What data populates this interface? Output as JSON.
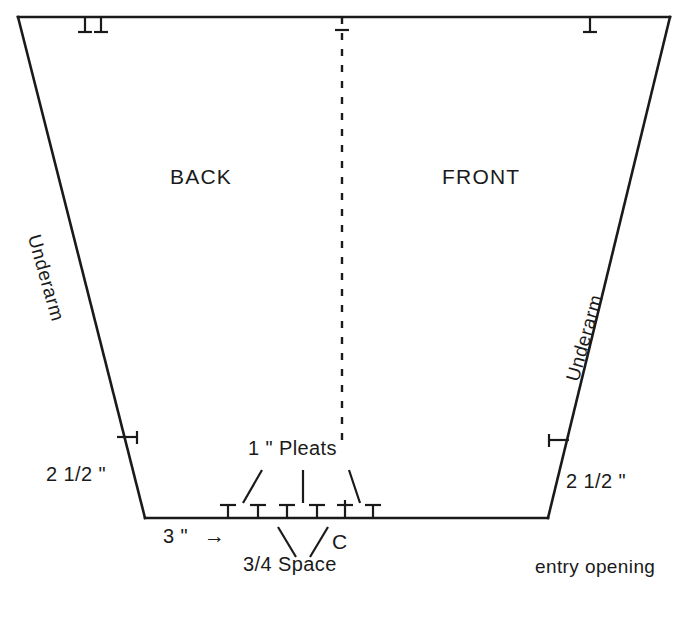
{
  "diagram": {
    "colors": {
      "line": "#1a1a1a",
      "text": "#1a1a1a",
      "background": "#ffffff"
    },
    "panels": {
      "back_label": "BACK",
      "front_label": "FRONT"
    },
    "edges": {
      "underarm_left_label": "Underarm",
      "underarm_right_label": "Underarm"
    },
    "measurements": {
      "left_hem_allowance": "2 1/2 \"",
      "right_hem_allowance": "2 1/2 \"",
      "pleat_width": "1 \" Pleats",
      "pleat_space": "3/4 Space",
      "bottom_offset": "3 \"",
      "arrow_glyph": "→",
      "center_mark": "C"
    },
    "annotations": {
      "entry_opening": "entry opening"
    },
    "geometry": {
      "top_left": [
        18,
        17
      ],
      "top_right": [
        670,
        17
      ],
      "bottom_left": [
        145,
        518
      ],
      "bottom_right": [
        548,
        518
      ],
      "center_line_x": 342,
      "center_line_top": 17,
      "center_line_bottom": 447,
      "top_ticks_x": [
        85,
        101,
        590
      ],
      "side_tick_left": [
        125,
        437
      ],
      "side_tick_right": [
        553,
        440
      ],
      "bottom_ticks_x": [
        228,
        258,
        287,
        317,
        345,
        373
      ],
      "bottom_tick_y": 518
    }
  }
}
